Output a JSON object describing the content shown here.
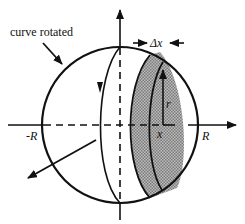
{
  "diagram": {
    "type": "solid-of-revolution-sphere",
    "labels": {
      "curve": "curve rotated",
      "delta_x": "Δx",
      "radius": "r",
      "position": "x",
      "neg_R": "-R",
      "pos_R": "R"
    },
    "colors": {
      "stroke": "#111111",
      "slice_fill": "#a8a8a8",
      "background": "#ffffff"
    }
  }
}
